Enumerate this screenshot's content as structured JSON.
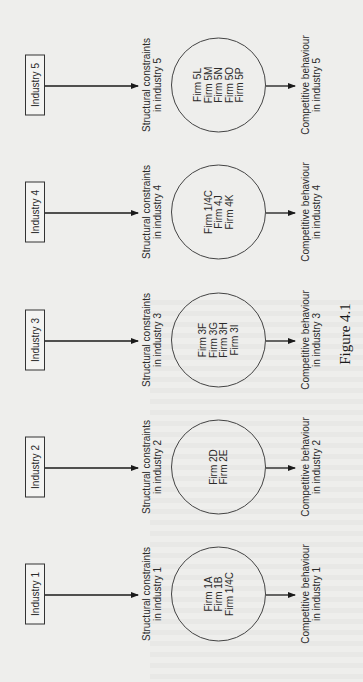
{
  "figure": {
    "caption": "Figure 4.1",
    "orientation": "rotated 90 degrees counter-clockwise",
    "industries": [
      {
        "label": "Industry 1",
        "structural": [
          "Structural constraints",
          "in industry 1"
        ],
        "firms": [
          "Firm 1A",
          "Firm 1B",
          "Firm 1/4C"
        ],
        "behaviour": [
          "Competitive behaviour",
          "in industry 1"
        ]
      },
      {
        "label": "Industry 2",
        "structural": [
          "Structural constraints",
          "in industry 2"
        ],
        "firms": [
          "Firm 2D",
          "Firm 2E"
        ],
        "behaviour": [
          "Competitive behaviour",
          "in industry 2"
        ]
      },
      {
        "label": "Industry 3",
        "structural": [
          "Structural constraints",
          "in industry 3"
        ],
        "firms": [
          "Firm 3F",
          "Firm 3G",
          "Firm 3H",
          "Firm 3I"
        ],
        "behaviour": [
          "Competitive behaviour",
          "in industry 3"
        ]
      },
      {
        "label": "Industry 4",
        "structural": [
          "Structural constraints",
          "in industry 4"
        ],
        "firms": [
          "Firm 1/4C",
          "Firm 4J",
          "Firm 4K"
        ],
        "behaviour": [
          "Competitive behaviour",
          "in industry 4"
        ]
      },
      {
        "label": "Industry 5",
        "structural": [
          "Structural constraints",
          "in industry 5"
        ],
        "firms": [
          "Firm 5L",
          "Firm 5M",
          "Firm 5N",
          "Firm 5O",
          "Firm 5P"
        ],
        "behaviour": [
          "Competitive behaviour",
          "in industry 5"
        ]
      }
    ]
  }
}
